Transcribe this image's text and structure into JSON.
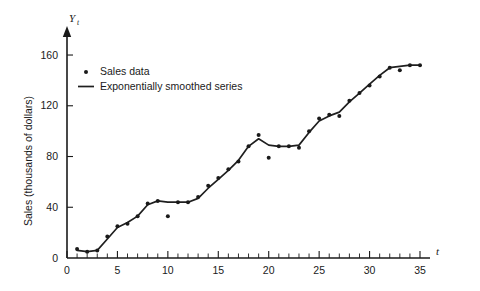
{
  "chart_data": {
    "type": "line",
    "title": "",
    "xlabel": "t",
    "ylabel": "Sales (thousands of dollars)",
    "y_axis_symbol": "Y",
    "y_axis_subscript": "t",
    "xlim": [
      0,
      35
    ],
    "ylim": [
      0,
      175
    ],
    "grid": false,
    "legend_position": "upper-left-inside",
    "x_ticks_major": [
      0,
      5,
      10,
      15,
      20,
      25,
      30,
      35
    ],
    "x_ticks_major_labels": [
      "0",
      "5",
      "10",
      "15",
      "20",
      "25",
      "30",
      "35"
    ],
    "x_tick_minor_step": 1,
    "y_ticks_major": [
      0,
      40,
      80,
      120,
      160
    ],
    "y_ticks_major_labels": [
      "0",
      "40",
      "80",
      "120",
      "160"
    ],
    "legend": [
      {
        "label": "Sales data",
        "marker": "dot"
      },
      {
        "label": "Exponentially smoothed series",
        "marker": "line"
      }
    ],
    "x": [
      1,
      2,
      3,
      4,
      5,
      6,
      7,
      8,
      9,
      10,
      11,
      12,
      13,
      14,
      15,
      16,
      17,
      18,
      19,
      20,
      21,
      22,
      23,
      24,
      25,
      26,
      27,
      28,
      29,
      30,
      31,
      32,
      33,
      34,
      35
    ],
    "series": [
      {
        "name": "Sales data",
        "marker": "dot",
        "values": [
          7,
          5,
          6,
          17,
          25,
          27,
          33,
          43,
          45,
          33,
          44,
          44,
          48,
          57,
          63,
          70,
          76,
          88,
          97,
          79,
          88,
          88,
          87,
          100,
          110,
          113,
          112,
          124,
          130,
          136,
          143,
          150,
          148,
          152,
          152
        ]
      },
      {
        "name": "Exponentially smoothed series",
        "marker": "line",
        "values": [
          6,
          5,
          6,
          15,
          24,
          28,
          33,
          42,
          45,
          44,
          44,
          44,
          47,
          55,
          62,
          69,
          77,
          88,
          94,
          89,
          88,
          88,
          89,
          99,
          108,
          112,
          115,
          123,
          130,
          137,
          144,
          150,
          151,
          152,
          152
        ]
      }
    ]
  }
}
